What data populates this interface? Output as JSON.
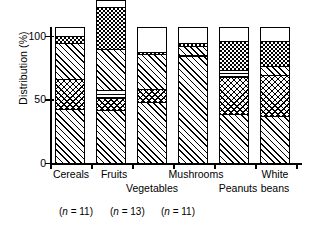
{
  "chart_data": {
    "type": "bar",
    "subtype": "stacked-bar",
    "title": "",
    "xlabel": "",
    "ylabel": "Distribution (%)",
    "ylim": [
      0,
      100
    ],
    "yticks": [
      0,
      50,
      100
    ],
    "ytick_labels": [
      "0",
      "50",
      "100"
    ],
    "grid": false,
    "legend": "none",
    "categories": [
      "Cereals",
      "Fruits",
      "Vegetables",
      "Mushrooms",
      "Peanuts",
      "White beans"
    ],
    "segment_names": [
      "diagonal-hatch",
      "checkerboard",
      "horizontal-lines",
      "diagonal-hatch-2",
      "dotted",
      "blank"
    ],
    "series": [
      {
        "name": "diagonal-hatch",
        "pattern": "p-diag",
        "values": [
          40,
          39,
          45,
          79,
          36,
          35
        ]
      },
      {
        "name": "checkerboard",
        "pattern": "p-cross",
        "values": [
          22,
          9,
          10,
          0,
          28,
          30
        ]
      },
      {
        "name": "horizontal-lines",
        "pattern": "p-horiz",
        "values": [
          0,
          6,
          0,
          1,
          5,
          0
        ]
      },
      {
        "name": "diagonal-hatch-2",
        "pattern": "p-diag",
        "values": [
          27,
          30,
          26,
          7,
          0,
          7
        ]
      },
      {
        "name": "dotted",
        "pattern": "p-dots",
        "values": [
          5,
          31,
          1,
          2,
          21,
          18
        ]
      },
      {
        "name": "blank",
        "pattern": "p-blank",
        "values": [
          6,
          5,
          18,
          11,
          10,
          10
        ]
      }
    ],
    "annotations": [
      {
        "text_prefix": "(",
        "italic": "n",
        "text_suffix": " = 11)",
        "full": "(n = 11)"
      },
      {
        "text_prefix": "(",
        "italic": "n",
        "text_suffix": " = 13)",
        "full": "(n = 13)"
      },
      {
        "text_prefix": "(",
        "italic": "n",
        "text_suffix": " = 11)",
        "full": "(n = 11)"
      }
    ]
  },
  "axis": {
    "ylabel": "Distribution (%)",
    "ytick_100": "100",
    "ytick_50": "50",
    "ytick_0": "0"
  },
  "xlabels": {
    "cereals": "Cereals",
    "fruits": "Fruits",
    "vegetables": "Vegetables",
    "mushrooms": "Mushrooms",
    "peanuts": "Peanuts",
    "white_beans_line1": "White",
    "white_beans_line2": "beans"
  },
  "notes": {
    "n1_open": "(",
    "n1_var": "n",
    "n1_rest": " = 11)",
    "n2_open": "(",
    "n2_var": "n",
    "n2_rest": " = 13)",
    "n3_open": "(",
    "n3_var": "n",
    "n3_rest": " = 11)"
  },
  "colors": {
    "ink": "#000000",
    "paper": "#ffffff"
  }
}
